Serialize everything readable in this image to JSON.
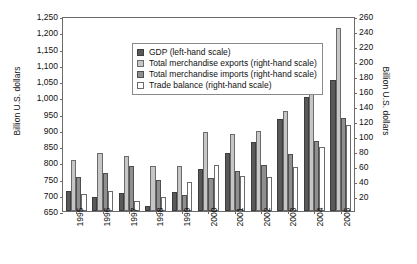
{
  "chart_data": {
    "type": "bar",
    "title": "",
    "xlabel": "",
    "ylabel": "Billion U.S. dollars",
    "ylabel_right": "Billion U.S. dollars",
    "grid": false,
    "legend_position": "top-left inside plot",
    "categories": [
      "1995",
      "1996",
      "1997",
      "1998",
      "1999",
      "2000",
      "2001",
      "2002",
      "2003",
      "2004",
      "2005"
    ],
    "axis_left": {
      "label": "Billion U.S. dollars",
      "min": 650,
      "max": 1250,
      "step": 50,
      "ticks": [
        "650",
        "700",
        "750",
        "800",
        "850",
        "900",
        "950",
        "1,000",
        "1,050",
        "1,100",
        "1,150",
        "1,200",
        "1,250"
      ]
    },
    "axis_right": {
      "label": "Billion U.S. dollars",
      "min": 0,
      "max": 260,
      "step": 20,
      "ticks": [
        "20",
        "40",
        "60",
        "80",
        "100",
        "120",
        "140",
        "160",
        "180",
        "200",
        "220",
        "240",
        "260"
      ]
    },
    "series": [
      {
        "name": "GDP (left-hand scale)",
        "key": "gdp",
        "scale": "left",
        "color": "#595959",
        "values": [
          713,
          694,
          705,
          665,
          709,
          779,
          829,
          861,
          933,
          1002,
          1053
        ]
      },
      {
        "name": "Total merchandise exports (right-hand scale)",
        "key": "exp",
        "scale": "right",
        "color": "#c6c6c6",
        "values": [
          68,
          78,
          74,
          60,
          60,
          105,
          103,
          107,
          133,
          161,
          244
        ]
      },
      {
        "name": "Total merchandise imports (right-hand scale)",
        "key": "imp",
        "scale": "right",
        "color": "#8f8f8f",
        "values": [
          45,
          51,
          60,
          41,
          21,
          44,
          53,
          61,
          76,
          93,
          124
        ]
      },
      {
        "name": "Trade balance (right-hand scale)",
        "key": "bal",
        "scale": "right",
        "color": "#ffffff",
        "values": [
          23,
          27,
          14,
          19,
          39,
          61,
          47,
          45,
          59,
          85,
          115
        ]
      }
    ],
    "legend": [
      {
        "label": "GDP (left-hand scale)",
        "swatch": "gdp"
      },
      {
        "label": "Total merchandise exports (right-hand scale)",
        "swatch": "exp"
      },
      {
        "label": "Total merchandise imports (right-hand scale)",
        "swatch": "imp"
      },
      {
        "label": "Trade balance (right-hand scale)",
        "swatch": "bal"
      }
    ]
  }
}
